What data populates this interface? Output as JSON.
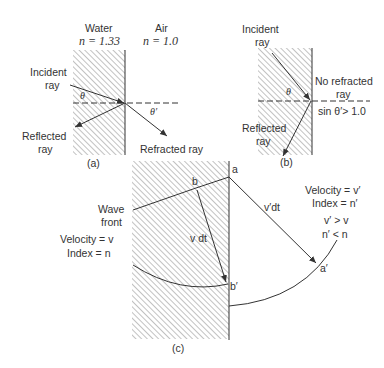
{
  "panel_a": {
    "caption": "(a)",
    "water_label": "Water",
    "water_index": "n = 1.33",
    "air_label": "Air",
    "air_index": "n = 1.0",
    "incident_label_1": "Incident",
    "incident_label_2": "ray",
    "reflected_label_1": "Reflected",
    "reflected_label_2": "ray",
    "refracted_label": "Refracted ray",
    "theta": "θ",
    "theta_prime": "θ′"
  },
  "panel_b": {
    "caption": "(b)",
    "incident_label_1": "Incident",
    "incident_label_2": "ray",
    "no_refracted_1": "No refracted",
    "no_refracted_2": "ray",
    "condition": "sin θ′> 1.0",
    "reflected_label_1": "Reflected",
    "reflected_label_2": "ray",
    "theta": "θ"
  },
  "panel_c": {
    "caption": "(c)",
    "wave_front_1": "Wave",
    "wave_front_2": "front",
    "velocity_left": "Velocity = v",
    "index_left": "Index = n",
    "velocity_right": "Velocity = v′",
    "index_right": "Index = n′",
    "cond_1": "v′ > v",
    "cond_2": "n′ < n",
    "point_a": "a",
    "point_b": "b",
    "point_a_prime": "a′",
    "point_b_prime": "b′",
    "v_dt": "v dt",
    "v_prime_dt": "v′dt"
  },
  "colors": {
    "line": "#333333",
    "hatch": "#777777"
  }
}
